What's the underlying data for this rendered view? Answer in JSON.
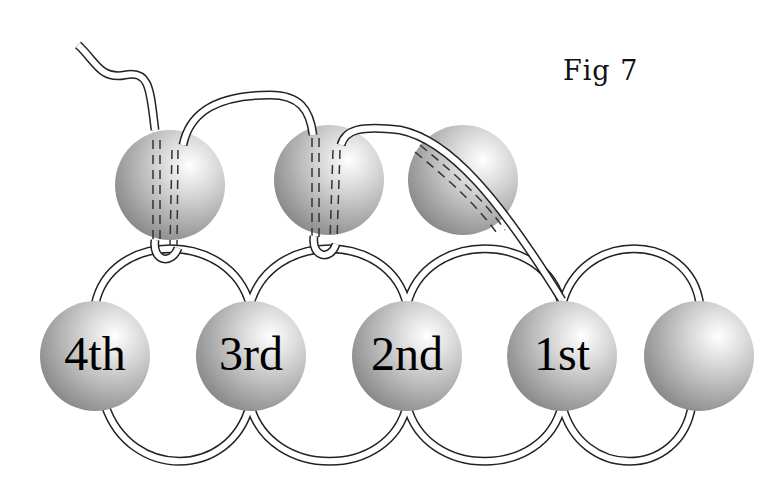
{
  "figure": {
    "title": "Fig 7",
    "bottom_row_labels": [
      "4th",
      "3rd",
      "2nd",
      "1st",
      ""
    ],
    "top_row_bead_count": 3,
    "bottom_row_bead_count": 5
  }
}
